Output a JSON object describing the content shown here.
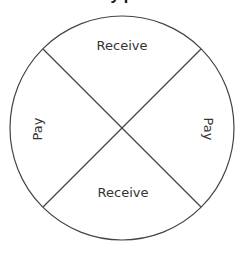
{
  "diagram": {
    "title_fragment": "y            p",
    "circle": {
      "cx": 122,
      "cy": 128,
      "r": 112,
      "stroke": "#444444"
    },
    "dividers": [
      {
        "x1": 43,
        "y1": 49,
        "x2": 201,
        "y2": 207
      },
      {
        "x1": 201,
        "y1": 49,
        "x2": 43,
        "y2": 207
      }
    ],
    "quadrants": {
      "top": {
        "label": "Receive"
      },
      "bottom": {
        "label": "Receive"
      },
      "left": {
        "label": "Pay"
      },
      "right": {
        "label": "Pay"
      }
    },
    "colors": {
      "line": "#444444",
      "text": "#333333",
      "background": "#ffffff"
    }
  }
}
